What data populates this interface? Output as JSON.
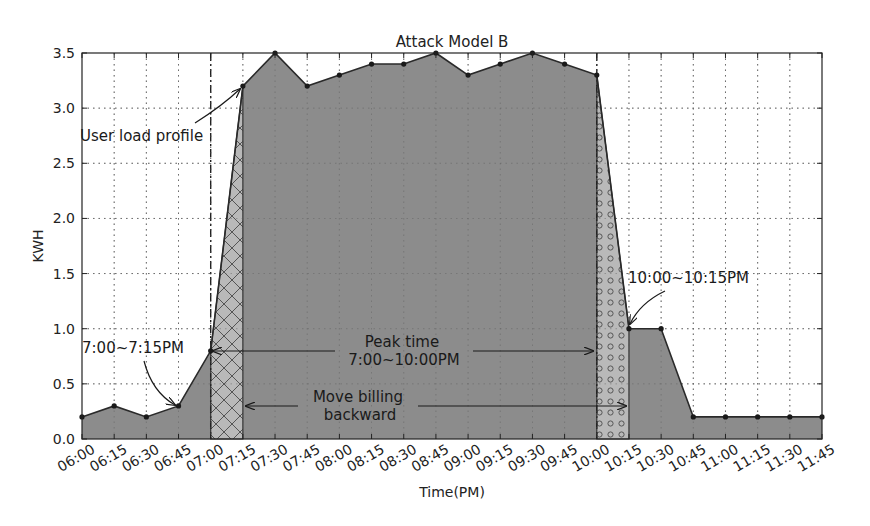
{
  "chart_data": {
    "type": "area",
    "title": "Attack Model B",
    "xlabel": "Time(PM)",
    "ylabel": "KWH",
    "ylim": [
      0,
      3.5
    ],
    "yticks": [
      "0.0",
      "0.5",
      "1.0",
      "1.5",
      "2.0",
      "2.5",
      "3.0",
      "3.5"
    ],
    "grid": true,
    "legend": null,
    "categories": [
      "06:00",
      "06:15",
      "06:30",
      "06:45",
      "07:00",
      "07:15",
      "07:30",
      "07:45",
      "08:00",
      "08:15",
      "08:30",
      "08:45",
      "09:00",
      "09:15",
      "09:30",
      "09:45",
      "10:00",
      "10:15",
      "10:30",
      "10:45",
      "11:00",
      "11:15",
      "11:30",
      "11:45"
    ],
    "series": [
      {
        "name": "User load profile",
        "values": [
          0.2,
          0.3,
          0.2,
          0.3,
          0.8,
          3.2,
          3.5,
          3.2,
          3.3,
          3.4,
          3.4,
          3.5,
          3.3,
          3.4,
          3.5,
          3.4,
          3.3,
          1.0,
          1.0,
          0.2,
          0.2,
          0.2,
          0.2,
          0.2
        ]
      }
    ],
    "shaded_regions": [
      {
        "name": "7:00~7:15PM",
        "from": "07:00",
        "to": "07:15",
        "pattern": "crosshatch"
      },
      {
        "name": "10:00~10:15PM",
        "from": "10:00",
        "to": "10:15",
        "pattern": "circles"
      }
    ],
    "vertical_lines": [
      {
        "at": "07:00",
        "style": "dash-dot"
      },
      {
        "at": "10:00",
        "style": "dash-dot"
      }
    ],
    "annotations": [
      {
        "text": "User load profile",
        "points_to": "07:15",
        "value": 3.2
      },
      {
        "text": "7:00~7:15PM",
        "points_to": "06:45",
        "value": 0.3
      },
      {
        "text": "10:00~10:15PM",
        "points_to": "10:15",
        "value": 1.0
      },
      {
        "text": "Peak time\n7:00~10:00PM",
        "type": "double-arrow",
        "from": "07:00",
        "to": "10:00",
        "y": 0.8
      },
      {
        "text": "Move billing\nbackward",
        "type": "arrow",
        "from": "10:00",
        "to": "07:15",
        "y": 0.3
      }
    ],
    "colors": {
      "fill": "#8c8c8c",
      "line": "#2a2a2a",
      "shade_light": "#b9b9b9",
      "grid": "#888888"
    }
  },
  "labels": {
    "title": "Attack Model B",
    "xlabel": "Time(PM)",
    "ylabel": "KWH",
    "annot_user_load": "User load profile",
    "annot_7": "7:00~7:15PM",
    "annot_10": "10:00~10:15PM",
    "annot_peak_1": "Peak time",
    "annot_peak_2": "7:00~10:00PM",
    "annot_move_1": "Move billing",
    "annot_move_2": "backward"
  }
}
